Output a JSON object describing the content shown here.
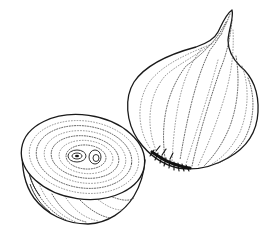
{
  "illustration": {
    "subject": "onion",
    "style": "stippled pen-and-ink line drawing",
    "background": "#ffffff",
    "ink_color": "#1a1a1a",
    "objects": [
      {
        "name": "whole-onion",
        "description": "Whole onion bulb with pointed tip at top right and dark root tuft at the bottom left"
      },
      {
        "name": "half-onion",
        "description": "Onion cut in half showing concentric rings with a two-lobed core"
      }
    ]
  }
}
